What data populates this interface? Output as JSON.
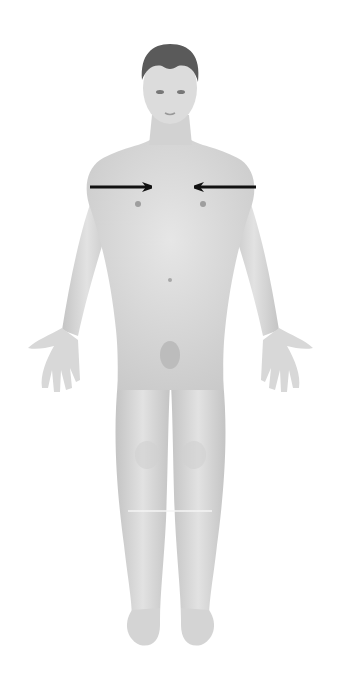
{
  "diagram": {
    "colors": {
      "background": "#ffffff",
      "skin": "#d9d9d9",
      "skin_shadow": "#bdbdbd",
      "hair": "#555555",
      "arrow": "#111111"
    },
    "arrows": [
      {
        "name": "left-arrow-medial",
        "from": [
          90,
          187
        ],
        "to": [
          158,
          187
        ],
        "direction": "right"
      },
      {
        "name": "right-arrow-medial",
        "from": [
          256,
          187
        ],
        "to": [
          188,
          187
        ],
        "direction": "left"
      }
    ]
  }
}
